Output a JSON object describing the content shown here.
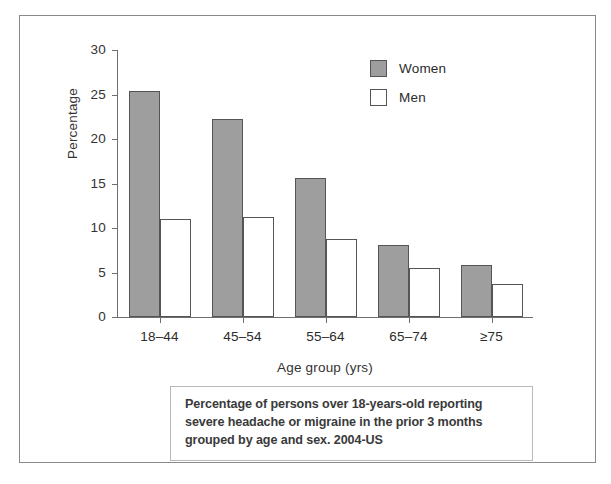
{
  "chart_data": {
    "type": "bar",
    "title": "",
    "xlabel": "Age group (yrs)",
    "ylabel": "Percentage",
    "categories": [
      "18–44",
      "45–54",
      "55–64",
      "65–74",
      "≥75"
    ],
    "series": [
      {
        "name": "Women",
        "color": "#9e9e9e",
        "values": [
          25.4,
          22.2,
          15.6,
          8.1,
          5.8
        ]
      },
      {
        "name": "Men",
        "color": "#ffffff",
        "values": [
          11.0,
          11.2,
          8.8,
          5.5,
          3.7
        ]
      }
    ],
    "ylim": [
      0,
      30
    ],
    "yticks": [
      0,
      5,
      10,
      15,
      20,
      25,
      30
    ],
    "ytick_labels": [
      "0",
      "5",
      "10",
      "15",
      "20",
      "25",
      "30"
    ],
    "grid": false,
    "legend_position": "top-right"
  },
  "legend": {
    "entries": [
      {
        "label": "Women",
        "swatch": "filled-gray-swatch"
      },
      {
        "label": "Men",
        "swatch": "empty-white-swatch"
      }
    ]
  },
  "caption": {
    "lines": [
      "Percentage of persons over 18-years-old reporting",
      "severe headache or migraine in the prior 3 months",
      "grouped by age and sex. 2004-US"
    ]
  }
}
